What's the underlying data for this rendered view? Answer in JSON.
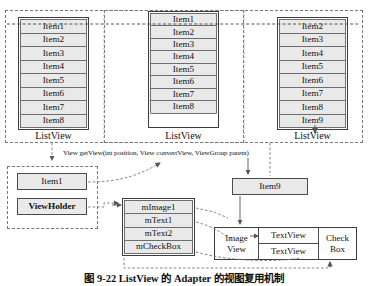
{
  "figure": {
    "caption": "图 9-22  ListView 的 Adapter 的视图复用机制",
    "colors": {
      "cell_fill": "#e9e9e9",
      "border": "#3d3d3d",
      "dashed": "#777777",
      "text": "#111111",
      "background": "#ffffff"
    }
  },
  "listviews": [
    {
      "name": "listview-left",
      "caption": "ListView",
      "items": [
        "Item1",
        "Item2",
        "Item3",
        "Item4",
        "Item5",
        "Item6",
        "Item7",
        "Item8"
      ],
      "empty_rows": 0
    },
    {
      "name": "listview-middle",
      "caption": "ListView",
      "items": [
        "Item1",
        "Item2",
        "Item3",
        "Item4",
        "Item5",
        "Item6",
        "Item7",
        "Item8"
      ],
      "empty_rows": 1
    },
    {
      "name": "listview-right",
      "caption": "ListView",
      "items": [
        "Item2",
        "Item3",
        "Item4",
        "Item5",
        "Item6",
        "Item7",
        "Item8",
        "Item9"
      ],
      "empty_rows": 0
    }
  ],
  "method_signature": "View getView(int position, View convertView, ViewGroup parent)",
  "recycle_group": {
    "name": "recycler-group",
    "items": [
      "Item1",
      "ViewHolder"
    ]
  },
  "viewholder_fields": {
    "name": "viewholder-fields",
    "fields": [
      "mImage1",
      "mText1",
      "mText2",
      "mCheckBox"
    ]
  },
  "new_item": {
    "name": "new-item-box",
    "label": "Item9"
  },
  "item_layout": {
    "name": "item-layout",
    "image_view": [
      "Image",
      "View"
    ],
    "text_views": [
      "TextView",
      "TextView"
    ],
    "check_box": [
      "Check",
      "Box"
    ]
  }
}
